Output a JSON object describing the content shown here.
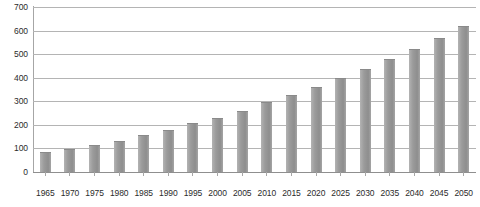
{
  "chart_data": {
    "type": "bar",
    "title": "",
    "subtitle": "",
    "xlabel": "",
    "ylabel": "",
    "categories": [
      "1965",
      "1970",
      "1975",
      "1980",
      "1985",
      "1990",
      "1995",
      "2000",
      "2005",
      "2010",
      "2015",
      "2020",
      "2025",
      "2030",
      "2035",
      "2040",
      "2045",
      "2050"
    ],
    "values": [
      83,
      97,
      113,
      133,
      155,
      180,
      207,
      230,
      258,
      295,
      325,
      362,
      398,
      437,
      478,
      523,
      570,
      618
    ],
    "series": [
      {
        "name": "",
        "values": [
          83,
          97,
          113,
          133,
          155,
          180,
          207,
          230,
          258,
          295,
          325,
          362,
          398,
          437,
          478,
          523,
          570,
          618
        ]
      }
    ],
    "ylim": [
      0,
      700
    ],
    "y_ticks": [
      0,
      100,
      200,
      300,
      400,
      500,
      600,
      700
    ],
    "y_tick_labels": [
      "0",
      "100",
      "200",
      "300",
      "400",
      "500",
      "600",
      "700"
    ],
    "grid": true,
    "grid_axis": "y",
    "legend": false,
    "legend_position": "none",
    "annotations": [],
    "colors": {
      "bar": "#9b9b9b",
      "bar_highlight": "#b3b3b3",
      "bar_shadow": "#8e8e8e",
      "gridline": "#b4b4b4",
      "axis": "#a6a6a6",
      "baseline": "#8f8f8f",
      "text": "#2b2b2b",
      "background": "#ffffff"
    }
  }
}
